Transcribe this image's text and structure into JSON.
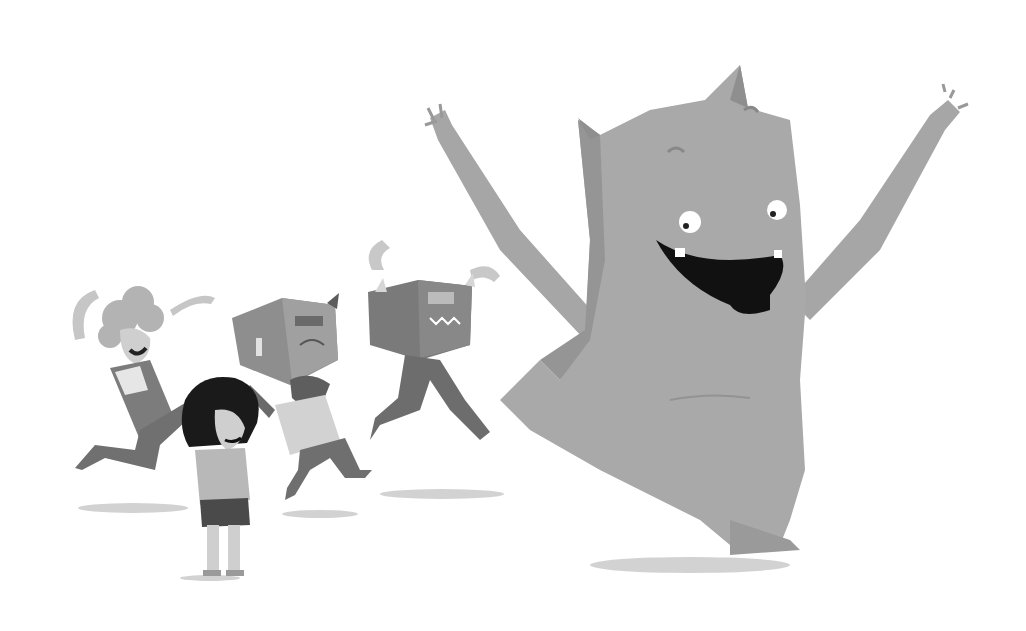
{
  "image": {
    "description": "Grayscale illustration of a large happy monster with raised arms dancing alongside children, two of whom wear cardboard box monster masks",
    "caption": "",
    "colors": {
      "background": "#ffffff",
      "monster": "#a8a8a8",
      "monster_shade": "#8e8e8e",
      "mouth": "#111111",
      "kid_dark": "#6e6e6e",
      "kid_mid": "#8a8a8a",
      "kid_light": "#c4c4c4",
      "hair_black": "#1a1a1a",
      "shadow": "#cfcfcf"
    }
  }
}
